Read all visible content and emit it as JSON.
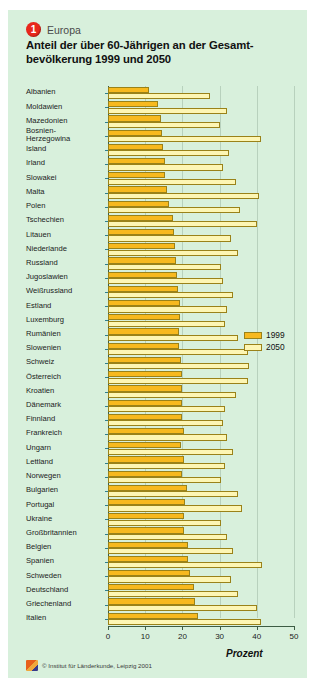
{
  "header": {
    "badge_number": "1",
    "region": "Europa",
    "title": "Anteil der über 60-Jährigen an der Gesamt-\nbevölkerung 1999 und 2050"
  },
  "legend": {
    "position": "right-middle",
    "items": [
      {
        "label": "1999",
        "color": "#f7b91f"
      },
      {
        "label": "2050",
        "color": "#fdf6b4"
      }
    ]
  },
  "axis": {
    "title": "Prozent",
    "ticks": [
      "0",
      "10",
      "20",
      "30",
      "40",
      "50"
    ]
  },
  "footer": {
    "copyright": "© Institut für Länderkunde, Leipzig 2001"
  },
  "colors": {
    "background": "#d8f0dc",
    "bar_1999": "#f7b91f",
    "bar_2050": "#fdf6b4",
    "bar_border": "#9a8219",
    "badge": "#e8271c",
    "axis": "#3d5c44"
  },
  "chart_data": {
    "type": "bar",
    "orientation": "horizontal",
    "subtitle": "Europa",
    "xlabel": "Prozent",
    "ylabel": "",
    "xlim": [
      0,
      50
    ],
    "xticks": [
      0,
      10,
      20,
      30,
      40,
      50
    ],
    "grid": true,
    "legend_position": "right",
    "categories": [
      "Albanien",
      "Moldawien",
      "Mazedonien",
      "Bosnien-\nHerzegowina",
      "Island",
      "Irland",
      "Slowakei",
      "Malta",
      "Polen",
      "Tschechien",
      "Litauen",
      "Niederlande",
      "Russland",
      "Jugoslawien",
      "Weißrussland",
      "Estland",
      "Luxemburg",
      "Rumänien",
      "Slowenien",
      "Schweiz",
      "Österreich",
      "Kroatien",
      "Dänemark",
      "Finnland",
      "Frankreich",
      "Ungarn",
      "Lettland",
      "Norwegen",
      "Bulgarien",
      "Portugal",
      "Ukraine",
      "Großbritannien",
      "Belgien",
      "Spanien",
      "Schweden",
      "Deutschland",
      "Griechenland",
      "Italien"
    ],
    "series": [
      {
        "name": "1999",
        "color": "#f7b91f",
        "values": [
          11.0,
          13.5,
          14.3,
          14.4,
          14.8,
          15.2,
          15.4,
          15.8,
          16.5,
          17.5,
          17.8,
          18.1,
          18.4,
          18.5,
          18.8,
          19.3,
          19.3,
          19.0,
          19.2,
          19.6,
          20.0,
          20.0,
          19.9,
          19.9,
          20.5,
          19.7,
          20.4,
          19.8,
          21.3,
          20.6,
          20.5,
          20.5,
          21.6,
          21.4,
          22.0,
          23.2,
          23.3,
          24.1
        ]
      },
      {
        "name": "2050",
        "color": "#fdf6b4",
        "values": [
          27.5,
          32.0,
          30.0,
          41.0,
          32.5,
          31.0,
          34.5,
          40.5,
          35.5,
          40.0,
          33.0,
          35.0,
          30.5,
          31.0,
          33.5,
          32.0,
          31.5,
          35.0,
          37.5,
          38.0,
          37.5,
          34.5,
          31.5,
          31.0,
          32.0,
          33.5,
          31.5,
          30.5,
          35.0,
          36.0,
          30.5,
          32.0,
          33.5,
          41.5,
          33.0,
          35.0,
          40.0,
          41.0
        ]
      }
    ]
  }
}
